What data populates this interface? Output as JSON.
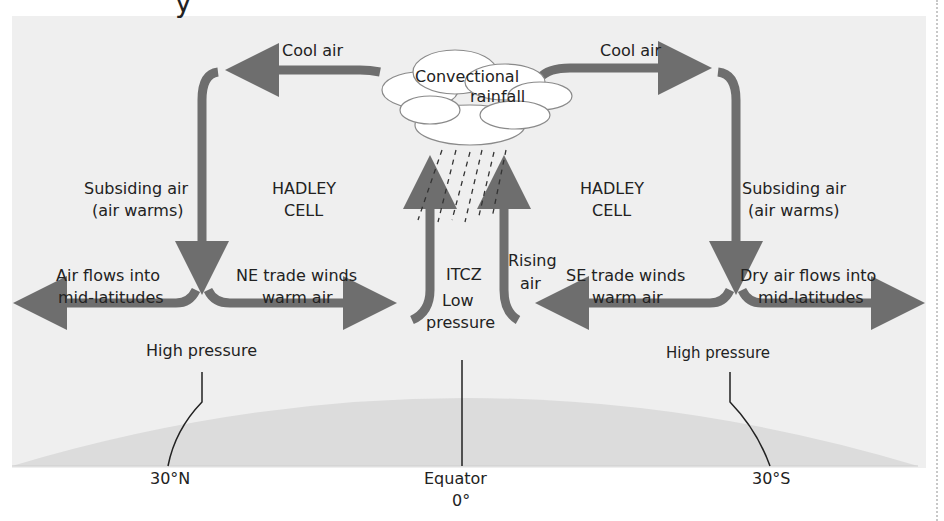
{
  "diagram": {
    "title_fragment": "y",
    "colors": {
      "arrow": "#6e6e6e",
      "panel_background": "#efefef",
      "earth": "#dcdcdc",
      "text": "#222222"
    },
    "labels": {
      "cool_air_left": "Cool air",
      "cool_air_right": "Cool air",
      "cloud_line1": "Convectional",
      "cloud_line2": "rainfall",
      "subsiding_left_1": "Subsiding air",
      "subsiding_left_2": "(air warms)",
      "subsiding_right_1": "Subsiding air",
      "subsiding_right_2": "(air warms)",
      "hadley_left_1": "HADLEY",
      "hadley_left_2": "CELL",
      "hadley_right_1": "HADLEY",
      "hadley_right_2": "CELL",
      "air_flows_left_1": "Air flows into",
      "air_flows_left_2": "mid-latitudes",
      "ne_trade_1": "NE trade winds",
      "ne_trade_2": "warm air",
      "itcz": "ITCZ",
      "low_pressure_1": "Low",
      "low_pressure_2": "pressure",
      "rising_1": "Rising",
      "rising_2": "air",
      "se_trade_1": "SE trade winds",
      "se_trade_2": "warm air",
      "dry_air_1": "Dry air flows into",
      "dry_air_2": "mid-latitudes",
      "high_pressure_left": "High pressure",
      "high_pressure_right": "High pressure",
      "lat_30n": "30°N",
      "equator": "Equator",
      "equator_deg": "0°",
      "lat_30s": "30°S"
    },
    "icons": [
      "cloud-icon",
      "rain-icon",
      "earth-surface"
    ]
  }
}
